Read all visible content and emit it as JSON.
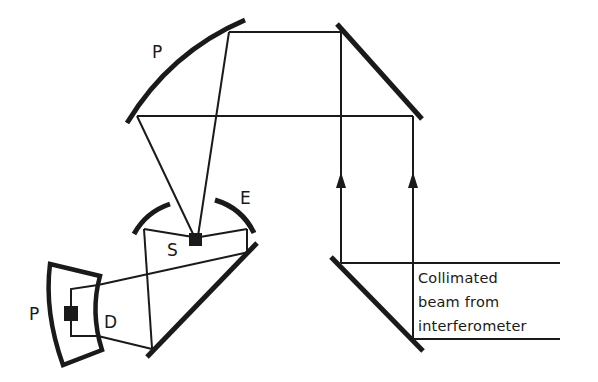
{
  "diagram": {
    "type": "optical-schematic",
    "labels": {
      "paraboloid_top": "P",
      "ellipsoid": "E",
      "source": "S",
      "paraboloid_detector": "P",
      "detector": "D"
    },
    "caption": {
      "line1": "Collimated",
      "line2": "beam from",
      "line3": "interferometer"
    },
    "colors": {
      "ink": "#1a1a1a",
      "background": "#ffffff"
    }
  }
}
